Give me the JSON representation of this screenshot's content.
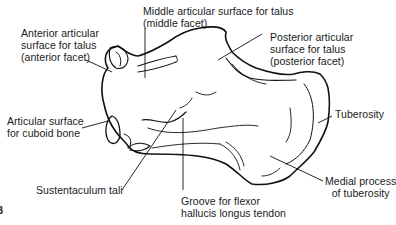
{
  "figure": {
    "panel_marker": "B",
    "colors": {
      "background": "#ffffff",
      "line": "#111111",
      "text": "#1a1a1a"
    }
  },
  "labels": {
    "anterior_facet": "Anterior articular\nsurface for talus\n(anterior facet)",
    "middle_facet": "Middle articular surface for talus\n(middle facet)",
    "posterior_facet": "Posterior articular\nsurface for talus\n(posterior facet)",
    "cuboid": "Articular surface\nfor cuboid bone",
    "tuberosity": "Tuberosity",
    "sustentaculum": "Sustentaculum tali",
    "groove": "Groove for flexor\nhallucis longus tendon",
    "medial_process": "Medial process\nof tuberosity"
  }
}
